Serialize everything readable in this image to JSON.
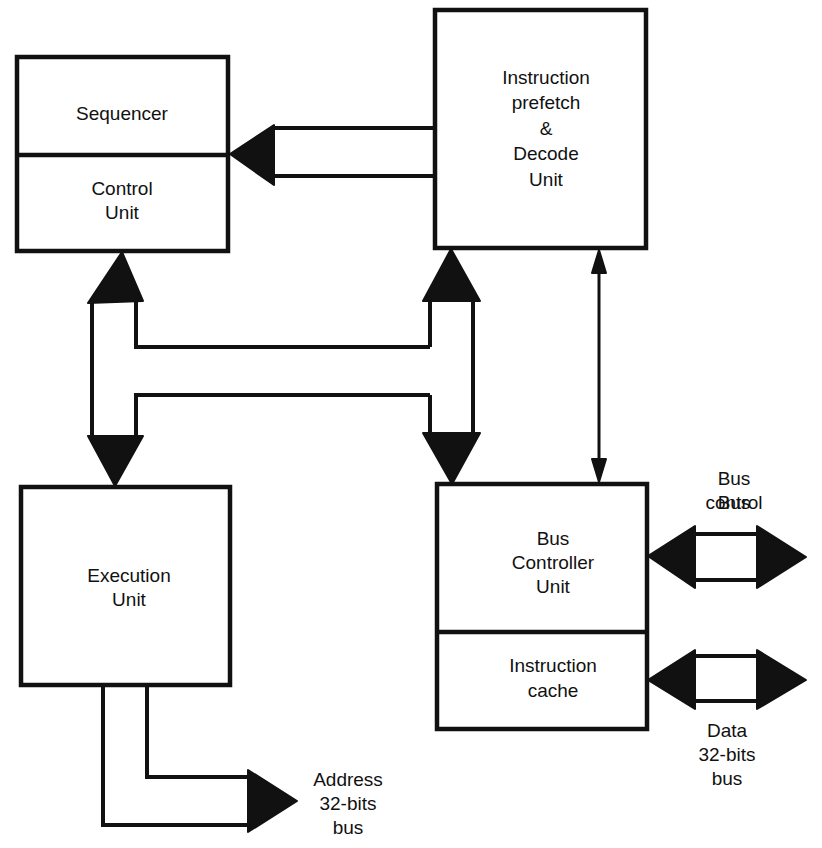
{
  "diagram": {
    "type": "block-diagram",
    "colors": {
      "ink": "#111111",
      "background": "#ffffff"
    },
    "blocks": {
      "sequencer": {
        "label": [
          "Sequencer"
        ]
      },
      "control_unit": {
        "label": [
          "Control",
          "Unit"
        ]
      },
      "decode_unit": {
        "label": [
          "Instruction",
          "prefetch",
          "&",
          "Decode",
          "Unit"
        ]
      },
      "execution_unit": {
        "label": [
          "Execution",
          "Unit"
        ]
      },
      "bus_controller": {
        "label": [
          "Bus",
          "Controller",
          "Unit"
        ]
      },
      "instruction_cache": {
        "label": [
          "Instruction",
          "cache"
        ]
      }
    },
    "external_labels": {
      "bus_control": [
        "Bus",
        "control"
      ],
      "data_bus": [
        "Data",
        "32-bits",
        "bus"
      ],
      "address_bus": [
        "Address",
        "32-bits",
        "bus"
      ]
    },
    "connections": [
      {
        "from": "decode_unit",
        "to": "sequencer",
        "style": "wide-arrow",
        "direction": "one-way"
      },
      {
        "from": "control_unit",
        "to": "execution_unit",
        "style": "wide-arrow",
        "direction": "two-way"
      },
      {
        "from": "decode_unit",
        "to": "bus_controller",
        "style": "wide-arrow",
        "direction": "two-way"
      },
      {
        "from": "control_unit",
        "to": "decode_unit",
        "style": "wide-bus",
        "direction": "shared"
      },
      {
        "from": "decode_unit",
        "to": "bus_controller",
        "style": "thin-arrow",
        "direction": "two-way"
      },
      {
        "from": "bus_controller",
        "to": "bus_control",
        "style": "wide-arrow",
        "direction": "two-way"
      },
      {
        "from": "instruction_cache",
        "to": "data_bus",
        "style": "wide-arrow",
        "direction": "two-way"
      },
      {
        "from": "execution_unit",
        "to": "address_bus",
        "style": "wide-arrow",
        "direction": "one-way"
      }
    ]
  }
}
